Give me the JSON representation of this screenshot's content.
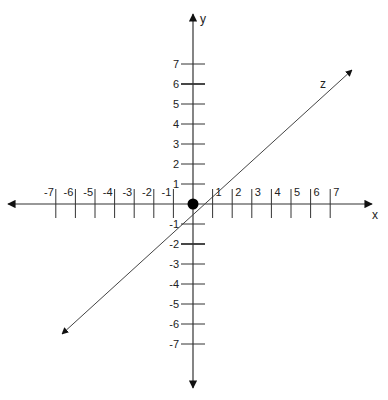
{
  "diagram": {
    "colors": {
      "line": "#333333",
      "text": "#222222",
      "origin": "#000000",
      "background": "#ffffff"
    },
    "origin": {
      "px": 193,
      "py": 204,
      "label": "origin"
    },
    "unit_px": {
      "x": 19.6,
      "y": 20
    },
    "axes": {
      "x": {
        "name": "x",
        "min": -7,
        "max": 7
      },
      "y": {
        "name": "y",
        "min": -7,
        "max": 7
      },
      "z": {
        "name": "z"
      }
    },
    "x_ticks": [
      "-7",
      "-6",
      "-5",
      "-4",
      "-3",
      "-2",
      "-1",
      "1",
      "2",
      "3",
      "4",
      "5",
      "6",
      "7"
    ],
    "y_ticks": [
      "7",
      "6",
      "5",
      "4",
      "3",
      "2",
      "1",
      "-1",
      "-2",
      "-3",
      "-4",
      "-5",
      "-6",
      "-7"
    ]
  }
}
